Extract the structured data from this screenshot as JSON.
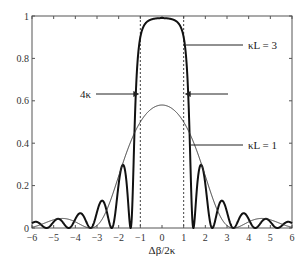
{
  "chart_data": {
    "type": "line",
    "title": "",
    "xlabel": "Δβ/2κ",
    "ylabel": "",
    "xlim": [
      -6,
      6
    ],
    "ylim": [
      0,
      1
    ],
    "grid": false,
    "x_ticks": [
      -6,
      -5,
      -4,
      -3,
      -2,
      -1,
      0,
      1,
      2,
      3,
      4,
      5,
      6
    ],
    "x_tick_labels": [
      "−6",
      "−5",
      "−4",
      "−3",
      "−2",
      "−1",
      "0",
      "1",
      "2",
      "3",
      "4",
      "5",
      "6"
    ],
    "y_ticks": [
      0,
      0.2,
      0.4,
      0.6,
      0.8,
      1
    ],
    "y_tick_labels": [
      "0",
      "0.2",
      "0.4",
      "0.6",
      "0.8",
      "1"
    ],
    "symmetric_about_zero": true,
    "x": [
      0,
      0.25,
      0.5,
      0.75,
      1,
      1.25,
      1.5,
      1.75,
      2,
      2.25,
      2.5,
      2.75,
      3,
      3.25,
      3.5,
      3.75,
      4,
      4.25,
      4.5,
      4.75,
      5,
      5.25,
      5.5,
      5.75,
      6
    ],
    "series": [
      {
        "name": "κL = 3",
        "kL": 3,
        "line_width": 2,
        "color": "#111111",
        "values": [
          0.99,
          0.989,
          0.984,
          0.967,
          0.9,
          0.518,
          0.034,
          0.292,
          0.207,
          0.013,
          0.056,
          0.129,
          0.075,
          0.002,
          0.031,
          0.07,
          0.043,
          0.002,
          0.016,
          0.042,
          0.03,
          0.002,
          0.009,
          0.028,
          0.022
        ]
      },
      {
        "name": "κL = 1",
        "kL": 1,
        "line_width": 1,
        "color": "#333333",
        "values": [
          0.58,
          0.574,
          0.561,
          0.535,
          0.5,
          0.453,
          0.393,
          0.323,
          0.245,
          0.167,
          0.097,
          0.044,
          0.011,
          0.0,
          0.004,
          0.016,
          0.029,
          0.039,
          0.045,
          0.044,
          0.039,
          0.03,
          0.02,
          0.011,
          0.004
        ]
      }
    ],
    "dashed_lines_x": [
      -1,
      1
    ],
    "annotations": [
      {
        "text": "κL = 3",
        "points_to_series": "κL = 3",
        "label_x": 248,
        "label_y": 45,
        "line_from_x": 186,
        "line_to_x": 243,
        "line_y": 45
      },
      {
        "text": "κL = 1",
        "points_to_series": "κL = 1",
        "label_x": 248,
        "label_y": 145,
        "line_from_x": 190,
        "line_to_x": 243,
        "line_y": 145
      },
      {
        "text": "4κ",
        "meaning": "bandwidth between arrows at x = ±1",
        "label_x": 80,
        "label_y": 98,
        "arrow_y": 94
      }
    ]
  }
}
